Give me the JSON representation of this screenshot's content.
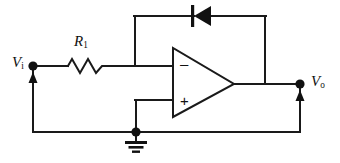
{
  "diagram": {
    "type": "electronic-schematic",
    "background_color": "#ffffff",
    "line_color": "#1a1a1a"
  },
  "labels": {
    "input_symbol": "V",
    "input_subscript": "i",
    "output_symbol": "V",
    "output_subscript": "o",
    "resistor_symbol": "R",
    "resistor_subscript": "1",
    "inverting_sign": "–",
    "noninverting_sign": "+"
  },
  "components": [
    {
      "name": "resistor-r1",
      "kind": "resistor",
      "label": "R1",
      "orientation": "horizontal",
      "x1": 68,
      "x2": 106,
      "y": 66,
      "peaks": 3
    },
    {
      "name": "diode-feedback",
      "kind": "diode",
      "orientation": "horizontal",
      "direction": "points-left",
      "anode_x": 211,
      "cathode_x": 193,
      "y": 16
    },
    {
      "name": "opamp",
      "kind": "operational-amplifier",
      "left_edge_x": 173,
      "apex_x": 234,
      "top_y": 48,
      "bottom_y": 117,
      "apex_y": 84,
      "inverting_input_y": 66,
      "noninverting_input_y": 100
    },
    {
      "name": "ground",
      "kind": "earth-ground",
      "x": 136,
      "y": 132
    }
  ],
  "nodes": [
    {
      "name": "input-node",
      "x": 33,
      "y": 66,
      "label": "Vi"
    },
    {
      "name": "output-node",
      "x": 300,
      "y": 84,
      "label": "Vo"
    },
    {
      "name": "ground-node",
      "x": 136,
      "y": 132,
      "label": "GND"
    }
  ],
  "arrows": [
    {
      "name": "input-voltage-arrow",
      "x": 33,
      "from_y": 128,
      "to_y": 74,
      "direction": "up"
    },
    {
      "name": "output-voltage-arrow",
      "x": 300,
      "from_y": 128,
      "to_y": 92,
      "direction": "up"
    }
  ],
  "wires": [
    {
      "name": "input-rail",
      "path": "M33,66 L68,66"
    },
    {
      "name": "resistor-to-summing",
      "path": "M106,66 L173,66"
    },
    {
      "name": "feedback-up",
      "path": "M135,66 L135,16"
    },
    {
      "name": "feedback-top-left",
      "path": "M135,16 L193,16"
    },
    {
      "name": "feedback-top-right",
      "path": "M211,16 L265,16"
    },
    {
      "name": "feedback-down",
      "path": "M265,16 L265,84"
    },
    {
      "name": "opamp-output",
      "path": "M234,84 L300,84"
    },
    {
      "name": "noninverting-stub",
      "path": "M136,100 L173,100"
    },
    {
      "name": "noninverting-down",
      "path": "M136,100 L136,132"
    },
    {
      "name": "ground-rail",
      "path": "M33,132 L300,132"
    },
    {
      "name": "left-return",
      "path": "M33,132 L33,66"
    },
    {
      "name": "right-return",
      "path": "M300,132 L300,84"
    }
  ]
}
